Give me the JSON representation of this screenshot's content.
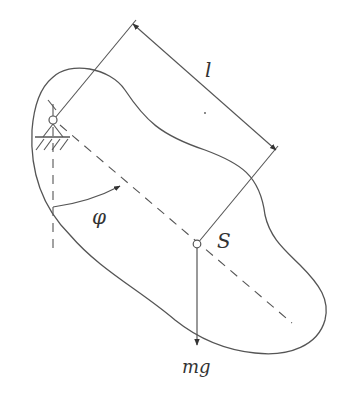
{
  "diagram": {
    "type": "physical pendulum schematic",
    "labels": {
      "length": "l",
      "angle": "φ",
      "center_of_mass": "S",
      "gravity_force": "mg"
    },
    "colors": {
      "stroke": "#555555",
      "text": "#333333",
      "background": "#ffffff"
    }
  }
}
